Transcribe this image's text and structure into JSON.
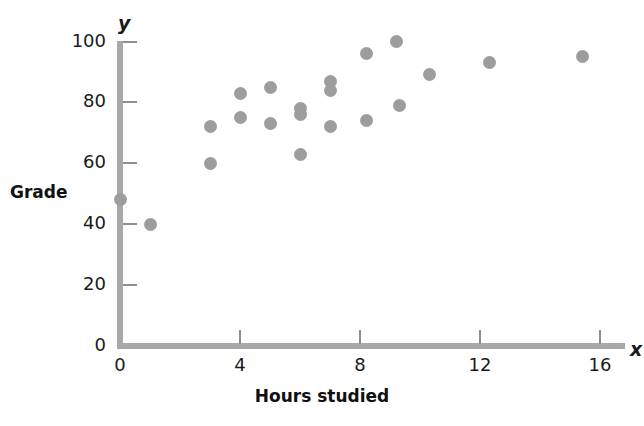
{
  "chart_data": {
    "type": "scatter",
    "title": "",
    "xlabel": "Hours studied",
    "ylabel": "Grade",
    "x_axis_symbol": "x",
    "y_axis_symbol": "y",
    "xlim": [
      0,
      16.8
    ],
    "ylim": [
      0,
      102
    ],
    "xticks": [
      0,
      4,
      8,
      12,
      16
    ],
    "yticks": [
      0,
      20,
      40,
      60,
      80,
      100
    ],
    "xtick_labels": [
      "0",
      "4",
      "8",
      "12",
      "16"
    ],
    "ytick_labels": [
      "0",
      "20",
      "40",
      "60",
      "80",
      "100"
    ],
    "grid": false,
    "legend": null,
    "point_color": "#9d9d9d",
    "axis_color": "#a8a8a8",
    "points": [
      {
        "x": 0.0,
        "y": 48
      },
      {
        "x": 1.0,
        "y": 40
      },
      {
        "x": 3.0,
        "y": 72
      },
      {
        "x": 3.0,
        "y": 60
      },
      {
        "x": 4.0,
        "y": 83
      },
      {
        "x": 4.0,
        "y": 75
      },
      {
        "x": 5.0,
        "y": 85
      },
      {
        "x": 5.0,
        "y": 73
      },
      {
        "x": 6.0,
        "y": 78
      },
      {
        "x": 6.0,
        "y": 76
      },
      {
        "x": 6.0,
        "y": 63
      },
      {
        "x": 7.0,
        "y": 87
      },
      {
        "x": 7.0,
        "y": 84
      },
      {
        "x": 7.0,
        "y": 72
      },
      {
        "x": 8.2,
        "y": 96
      },
      {
        "x": 8.2,
        "y": 74
      },
      {
        "x": 9.2,
        "y": 100
      },
      {
        "x": 9.3,
        "y": 79
      },
      {
        "x": 10.3,
        "y": 89
      },
      {
        "x": 12.3,
        "y": 93
      },
      {
        "x": 15.4,
        "y": 95
      }
    ]
  }
}
